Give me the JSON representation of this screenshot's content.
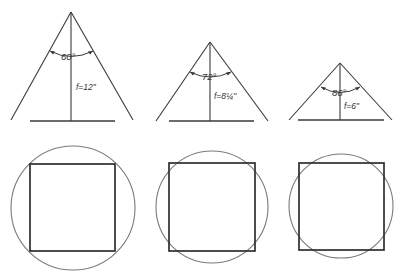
{
  "diagram": {
    "lenses": [
      {
        "angle_label": "60°",
        "focal_label": "f=12\"",
        "apex": [
          71,
          12
        ],
        "left_end": [
          11,
          120
        ],
        "right_end": [
          133,
          120
        ],
        "base": [
          30,
          115,
          121
        ],
        "arc": {
          "x1": 50,
          "y1": 51,
          "x2": 93,
          "y2": 51,
          "r": 40
        },
        "angle_text_pos": [
          62,
          60
        ],
        "focal_text_pos": [
          77,
          90
        ],
        "coverage": {
          "circle": {
            "cx": 73,
            "cy": 208,
            "r": 62
          },
          "square": {
            "x": 30,
            "y": 164,
            "w": 85,
            "h": 87
          }
        }
      },
      {
        "angle_label": "72°",
        "focal_label": "f=8¼\"",
        "apex": [
          210,
          42
        ],
        "left_end": [
          156,
          121
        ],
        "right_end": [
          268,
          121
        ],
        "base": [
          169,
          254,
          121
        ],
        "arc": {
          "x1": 190,
          "y1": 72,
          "x2": 231,
          "y2": 72,
          "r": 36
        },
        "angle_text_pos": [
          203,
          80
        ],
        "focal_text_pos": [
          215,
          99
        ],
        "coverage": {
          "circle": {
            "cx": 212,
            "cy": 207,
            "r": 56
          },
          "square": {
            "x": 169,
            "y": 163,
            "w": 86,
            "h": 88
          }
        }
      },
      {
        "angle_label": "86°",
        "focal_label": "f=6\"",
        "apex": [
          340,
          63
        ],
        "left_end": [
          289,
          120
        ],
        "right_end": [
          392,
          120
        ],
        "base": [
          298,
          384,
          120
        ],
        "arc": {
          "x1": 321,
          "y1": 87,
          "x2": 360,
          "y2": 87,
          "r": 32
        },
        "angle_text_pos": [
          333,
          96
        ],
        "focal_text_pos": [
          345,
          109
        ],
        "coverage": {
          "circle": {
            "cx": 341,
            "cy": 206,
            "r": 52
          },
          "square": {
            "x": 299,
            "y": 163,
            "w": 85,
            "h": 87
          }
        }
      }
    ]
  }
}
